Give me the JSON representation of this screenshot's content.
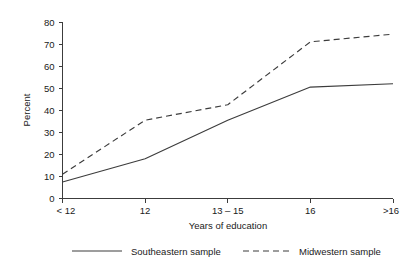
{
  "chart_data": {
    "type": "line",
    "title": "",
    "xlabel": "Years of education",
    "ylabel": "Percent",
    "categories": [
      "< 12",
      "12",
      "13 – 15",
      "16",
      ">16"
    ],
    "ylim": [
      0,
      80
    ],
    "yticks": [
      0,
      10,
      20,
      30,
      40,
      50,
      60,
      70,
      80
    ],
    "ytick_labels": [
      "0",
      "10",
      "20",
      "30",
      "40",
      "50",
      "60",
      "70",
      "80"
    ],
    "grid": false,
    "legend_position": "bottom",
    "series": [
      {
        "name": "Southeastern sample",
        "style": "solid",
        "color": "#3c3c3c",
        "values": [
          7.5,
          18,
          35.5,
          50.5,
          52
        ]
      },
      {
        "name": "Midwestern sample",
        "style": "dashed",
        "color": "#3c3c3c",
        "values": [
          11,
          35.5,
          42.5,
          71,
          74.5
        ]
      }
    ]
  },
  "axis": {
    "ylabel": "Percent",
    "xlabel": "Years of education"
  },
  "legend": {
    "items": [
      {
        "label": "Southeastern sample",
        "style": "solid"
      },
      {
        "label": "Midwestern sample",
        "style": "dashed"
      }
    ]
  }
}
